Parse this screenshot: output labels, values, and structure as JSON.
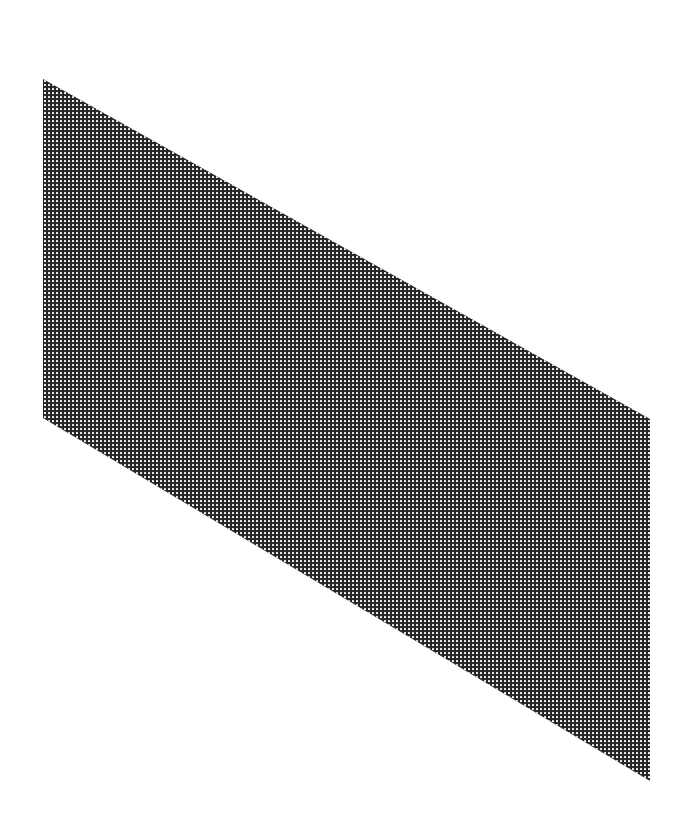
{
  "figure": {
    "type": "mesh-parallelogram",
    "colors": {
      "background": "#ffffff",
      "mesh_lines": "#2a2a2a",
      "mesh_holes": "#f4f4f4"
    },
    "vertices": [
      {
        "name": "top-left",
        "x": 43,
        "y": 79
      },
      {
        "name": "top-right",
        "x": 650,
        "y": 419
      },
      {
        "name": "bottom-right",
        "x": 650,
        "y": 781
      },
      {
        "name": "bottom-left",
        "x": 43,
        "y": 418
      }
    ],
    "grid_pitch_px": 4
  }
}
